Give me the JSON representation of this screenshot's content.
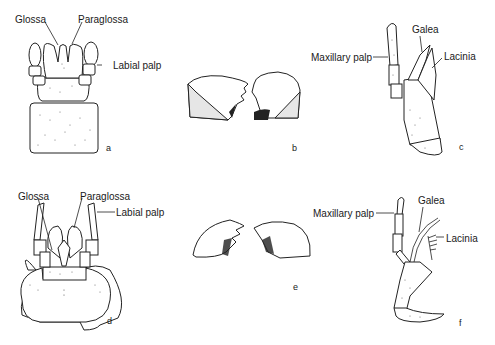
{
  "figure": {
    "panels": [
      {
        "id": "a",
        "letter": "a",
        "description": "Labium (upper left)",
        "labels": [
          "Glossa",
          "Paraglossa",
          "Labial palp"
        ]
      },
      {
        "id": "b",
        "letter": "b",
        "description": "Pair of mandibles (upper middle)",
        "labels": []
      },
      {
        "id": "c",
        "letter": "c",
        "description": "Maxilla (upper right)",
        "labels": [
          "Maxillary palp",
          "Galea",
          "Lacinia"
        ]
      },
      {
        "id": "d",
        "letter": "d",
        "description": "Labium (lower left)",
        "labels": [
          "Glossa",
          "Paraglossa",
          "Labial palp"
        ]
      },
      {
        "id": "e",
        "letter": "e",
        "description": "Pair of mandibles (lower middle)",
        "labels": []
      },
      {
        "id": "f",
        "letter": "f",
        "description": "Maxilla (lower right)",
        "labels": [
          "Maxillary palp",
          "Galea",
          "Lacinia"
        ]
      }
    ]
  },
  "labels": {
    "a_glossa": "Glossa",
    "a_paraglossa": "Paraglossa",
    "a_labial_palp": "Labial palp",
    "a_letter": "a",
    "b_letter": "b",
    "c_maxillary_palp": "Maxillary palp",
    "c_galea": "Galea",
    "c_lacinia": "Lacinia",
    "c_letter": "c",
    "d_glossa": "Glossa",
    "d_paraglossa": "Paraglossa",
    "d_labial_palp": "Labial palp",
    "d_letter": "d",
    "e_letter": "e",
    "f_maxillary_palp": "Maxillary palp",
    "f_galea": "Galea",
    "f_lacinia": "Lacinia",
    "f_letter": "f"
  }
}
